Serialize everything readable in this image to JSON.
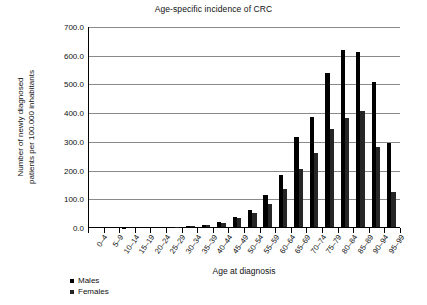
{
  "chart_data": {
    "type": "bar",
    "title": "Age-specific incidence of CRC",
    "xlabel": "Age at diagnosis",
    "ylabel_line1": "Number of newly diagnosed",
    "ylabel_line2": "patients per 100.000 inhabitants",
    "ylim": [
      0,
      700
    ],
    "ytick_step": 100,
    "ytick_labels": [
      "700.0",
      "600.0",
      "500.0",
      "400.0",
      "300.0",
      "200.0",
      "100.0",
      "0.0"
    ],
    "ytick_values": [
      700,
      600,
      500,
      400,
      300,
      200,
      100,
      0
    ],
    "grid": true,
    "legend_position": "bottom-left",
    "categories": [
      "0–4",
      "5–9",
      "10–14",
      "15–19",
      "20–24",
      "25–29",
      "30–34",
      "35–39",
      "40–44",
      "45–49",
      "50–54",
      "55–59",
      "60–64",
      "65–69",
      "70–74",
      "75–79",
      "80–84",
      "85–89",
      "90–94",
      "95–99"
    ],
    "series": [
      {
        "name": "Males",
        "color": "#000000",
        "values": [
          0,
          0,
          0,
          0,
          0,
          1,
          3,
          8,
          16,
          34,
          60,
          113,
          180,
          313,
          382,
          535,
          615,
          610,
          505,
          292
        ]
      },
      {
        "name": "Females",
        "color": "#262626",
        "values": [
          0,
          0,
          0,
          0,
          0,
          1,
          4,
          7,
          15,
          30,
          50,
          80,
          134,
          201,
          257,
          340,
          380,
          405,
          278,
          123
        ]
      }
    ]
  }
}
